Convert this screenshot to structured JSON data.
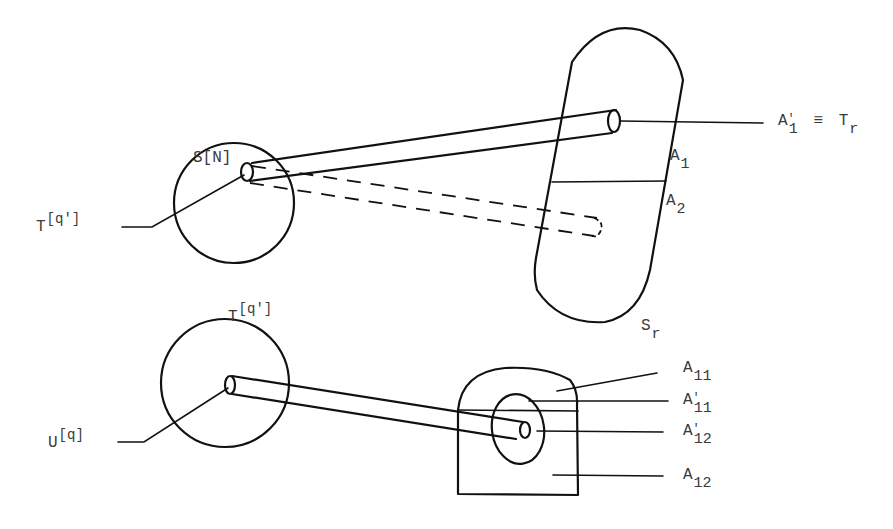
{
  "figure": {
    "top": {
      "sphere_label": "S[N]",
      "tube_origin_label": {
        "base": "T",
        "sup": "[q']"
      },
      "target_label": {
        "base": "S",
        "sub": "r"
      },
      "region_labels": [
        {
          "base": "A",
          "sub": "1"
        },
        {
          "base": "A",
          "sub": "2"
        }
      ],
      "equivalence_label": {
        "lhs_base": "A",
        "lhs_prime": "'",
        "lhs_sub": "1",
        "op": "≡",
        "rhs_base": "T",
        "rhs_sub": "r"
      }
    },
    "bottom": {
      "sphere_label": {
        "base": "T",
        "sup": "[q']"
      },
      "origin_label": {
        "base": "U",
        "sup": "[q]"
      },
      "region_labels": [
        {
          "base": "A",
          "prime": "",
          "sub": "11"
        },
        {
          "base": "A",
          "prime": "'",
          "sub": "11"
        },
        {
          "base": "A",
          "prime": "'",
          "sub": "12"
        },
        {
          "base": "A",
          "prime": "",
          "sub": "12"
        }
      ]
    },
    "colors": {
      "ink": "#111111",
      "label": "#3a3a3a",
      "background": "#ffffff"
    }
  }
}
